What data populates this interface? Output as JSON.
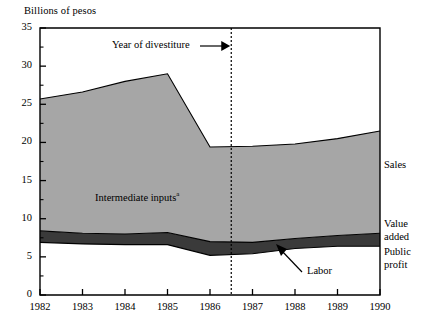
{
  "chart_data": {
    "type": "area",
    "title": "",
    "ylabel": "Billions of pesos",
    "xlabel": "",
    "ylim": [
      0,
      35
    ],
    "xlim": [
      1982,
      1990
    ],
    "ytick_step": 5,
    "yminor_step": 2.5,
    "grid": false,
    "legend_position": "right-inline",
    "x": [
      1982,
      1983,
      1984,
      1985,
      1986,
      1987,
      1988,
      1989,
      1990
    ],
    "categories": [
      "1982",
      "1983",
      "1984",
      "1985",
      "1986",
      "1987",
      "1988",
      "1989",
      "1990"
    ],
    "ytick_labels": [
      "0",
      "5",
      "10",
      "15",
      "20",
      "25",
      "30",
      "35"
    ],
    "ytick_values": [
      0,
      5,
      10,
      15,
      20,
      25,
      30,
      35
    ],
    "stack_order_bottom_to_top": [
      "Public profit",
      "Labor",
      "Intermediate inputs"
    ],
    "series": [
      {
        "name": "Public profit",
        "cumulative_top": [
          6.9,
          6.7,
          6.6,
          6.6,
          5.2,
          5.4,
          6.1,
          6.4,
          6.4
        ],
        "values": [
          6.9,
          6.7,
          6.6,
          6.6,
          5.2,
          5.4,
          6.1,
          6.4,
          6.4
        ],
        "fill": "#ffffff"
      },
      {
        "name": "Labor",
        "cumulative_top": [
          8.4,
          8.1,
          8.0,
          8.2,
          7.0,
          6.9,
          7.4,
          7.8,
          8.1
        ],
        "values": [
          1.5,
          1.4,
          1.4,
          1.6,
          1.8,
          1.5,
          1.3,
          1.4,
          1.7
        ],
        "fill": "#3a3a3a"
      },
      {
        "name": "Intermediate inputs",
        "cumulative_top": [
          25.7,
          26.6,
          28.0,
          29.0,
          19.4,
          19.5,
          19.8,
          20.5,
          21.5
        ],
        "values": [
          17.3,
          18.5,
          20.0,
          20.8,
          12.4,
          12.6,
          12.4,
          12.7,
          13.4
        ],
        "fill": "#a6a6a6"
      }
    ],
    "top_line": {
      "name": "Sales",
      "values": [
        25.7,
        26.6,
        28.0,
        29.0,
        19.4,
        19.5,
        19.8,
        20.5,
        21.5
      ]
    },
    "annotations": [
      {
        "name": "year-of-divestiture",
        "text": "Year of divestiture",
        "x": 1986.5,
        "type": "vertical-dotted-line-with-arrow"
      },
      {
        "name": "intermediate-inputs",
        "text": "Intermediate inputs",
        "footnote": "a"
      },
      {
        "name": "labor",
        "text": "Labor",
        "type": "arrow-callout"
      }
    ],
    "right_labels": [
      {
        "name": "Sales",
        "text": "Sales",
        "y_value": 21.5
      },
      {
        "name": "Value added",
        "line1": "Value",
        "line2": "added",
        "y_value": 14.0
      },
      {
        "name": "Public profit",
        "line1": "Public",
        "line2": "profit",
        "y_value": 5.0
      }
    ]
  },
  "labels": {
    "y_axis_title": "Billions of pesos",
    "divestiture": "Year of divestiture",
    "intermediate_inputs": "Intermediate inputs",
    "intermediate_inputs_footnote": "a",
    "labor": "Labor",
    "sales": "Sales",
    "value_added_line1": "Value",
    "value_added_line2": "added",
    "public_profit_line1": "Public",
    "public_profit_line2": "profit"
  },
  "ticks": {
    "y": [
      "0",
      "5",
      "10",
      "15",
      "20",
      "25",
      "30",
      "35"
    ],
    "x": [
      "1982",
      "1983",
      "1984",
      "1985",
      "1986",
      "1987",
      "1988",
      "1989",
      "1990"
    ]
  },
  "colors": {
    "intermediate_inputs_fill": "#a6a6a6",
    "labor_fill": "#3a3a3a",
    "public_profit_fill": "#ffffff",
    "axis": "#000000",
    "background": "#ffffff"
  }
}
